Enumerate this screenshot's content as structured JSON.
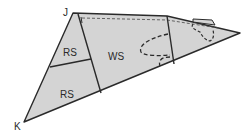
{
  "diagram": {
    "title": "",
    "vertices": {
      "J": {
        "label": "J"
      },
      "K": {
        "label": "K"
      }
    },
    "regions": [
      {
        "id": "rs-upper",
        "label": "RS"
      },
      {
        "id": "rs-lower",
        "label": "RS"
      },
      {
        "id": "ws",
        "label": "WS"
      }
    ],
    "marks": {
      "top_left_tick": "I"
    },
    "colors": {
      "fill": "#d4d4d4",
      "stroke": "#2a2a2a",
      "dashed": "#3a3a3a",
      "background": "#ffffff"
    }
  }
}
